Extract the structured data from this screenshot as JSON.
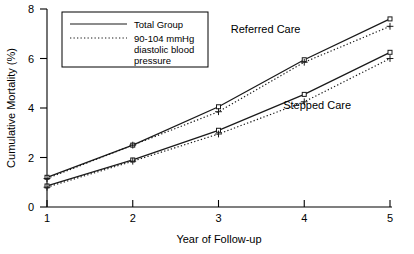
{
  "chart_data": {
    "type": "line",
    "title": "",
    "xlabel": "Year of Follow-up",
    "ylabel": "Cumulative Mortality (%)",
    "x": [
      1,
      2,
      3,
      4,
      5
    ],
    "xtick_labels": [
      "1",
      "2",
      "3",
      "4",
      "5"
    ],
    "ytick_labels": [
      "0",
      "2",
      "4",
      "6",
      "8"
    ],
    "ytick_values": [
      0,
      2,
      4,
      6,
      8
    ],
    "xlim": [
      1,
      5
    ],
    "ylim": [
      0,
      8
    ],
    "grid": false,
    "legend_position": "upper-left-inside",
    "series": [
      {
        "name": "Referred Care — Total Group",
        "group": "Referred Care",
        "style": "solid",
        "marker": "square",
        "values": [
          1.2,
          2.5,
          4.05,
          5.95,
          7.6
        ]
      },
      {
        "name": "Referred Care — 90-104 mmHg diastolic blood pressure",
        "group": "Referred Care",
        "style": "dotted",
        "marker": "plus",
        "values": [
          1.15,
          2.5,
          3.85,
          5.85,
          7.3
        ]
      },
      {
        "name": "Stepped Care — Total Group",
        "group": "Stepped Care",
        "style": "solid",
        "marker": "square",
        "values": [
          0.85,
          1.9,
          3.1,
          4.55,
          6.25
        ]
      },
      {
        "name": "Stepped Care — 90-104 mmHg diastolic blood pressure",
        "group": "Stepped Care",
        "style": "dotted",
        "marker": "plus",
        "values": [
          0.8,
          1.85,
          2.95,
          4.25,
          6.0
        ]
      }
    ],
    "annotations": [
      {
        "text": "Referred Care",
        "x": 3.55,
        "y": 7.05
      },
      {
        "text": "Stepped Care",
        "x": 4.15,
        "y": 3.95
      }
    ],
    "legend": {
      "entries": [
        {
          "label": "Total Group",
          "style": "solid"
        },
        {
          "label": "90-104 mmHg diastolic blood pressure",
          "style": "dotted"
        }
      ],
      "label_lines": [
        [
          "Total Group"
        ],
        [
          "90-104 mmHg",
          "diastolic blood",
          "pressure"
        ]
      ]
    },
    "colors": {
      "line": "#1a1a1a",
      "axis": "#000000",
      "background": "#ffffff"
    }
  }
}
